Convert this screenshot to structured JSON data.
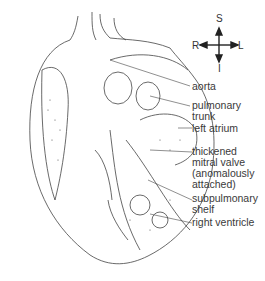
{
  "compass": {
    "S": "S",
    "R": "R",
    "L": "L",
    "I": "I"
  },
  "labels": [
    {
      "text": "aorta"
    },
    {
      "text": "pulmonary\ntrunk"
    },
    {
      "text": "left atrium"
    },
    {
      "text": "thickened\nmitral valve\n(anomalously\nattached)"
    },
    {
      "text": "subpulmonary\nshelf"
    },
    {
      "text": "right ventricle"
    }
  ]
}
